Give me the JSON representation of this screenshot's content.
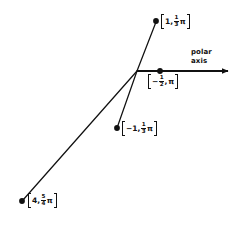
{
  "figure": {
    "background_color": "#ffffff",
    "ink_color": "#111111",
    "width": 243,
    "height": 229
  },
  "axis": {
    "name": "polar axis",
    "label_line1": "polar",
    "label_line2": "axis",
    "origin": {
      "x": 137,
      "y": 71
    },
    "end": {
      "x": 234,
      "y": 71
    },
    "arrowhead": true
  },
  "points": [
    {
      "id": "point-1-one-third-pi",
      "label_open": "[",
      "label_close": "]",
      "r": "1",
      "negative": false,
      "numerator": "1",
      "denominator": "3",
      "symbol": "π",
      "comma": ",",
      "plain_label": "[1, 1/3 π]",
      "dot": {
        "x": 156,
        "y": 21
      },
      "label_pos": {
        "x": 161,
        "y": 13
      }
    },
    {
      "id": "point-neg-half-pi",
      "label_open": "[",
      "label_close": "]",
      "r": "",
      "negative": true,
      "numerator": "1",
      "denominator": "2",
      "symbol": "π",
      "comma": ",",
      "plain_label": "[-1/2, π]",
      "dot": {
        "x": 160,
        "y": 71
      },
      "label_pos": {
        "x": 148,
        "y": 73
      }
    },
    {
      "id": "point-neg1-one-third-pi",
      "label_open": "[",
      "label_close": "]",
      "r": "−1",
      "negative": false,
      "numerator": "1",
      "denominator": "3",
      "symbol": "π",
      "comma": ",",
      "plain_label": "[-1, 1/3 π]",
      "dot": {
        "x": 117,
        "y": 128
      },
      "label_pos": {
        "x": 122,
        "y": 120
      }
    },
    {
      "id": "point-4-five-fourths-pi",
      "label_open": "[",
      "label_close": "]",
      "r": "4",
      "negative": false,
      "numerator": "5",
      "denominator": "4",
      "symbol": "π",
      "comma": ",",
      "plain_label": "[4, 5/4 π]",
      "dot": {
        "x": 22,
        "y": 201
      },
      "label_pos": {
        "x": 28,
        "y": 192
      }
    }
  ],
  "rays": [
    {
      "id": "ray-to-1-one-third-pi",
      "from": {
        "x": 137,
        "y": 71
      },
      "to": {
        "x": 156,
        "y": 22
      }
    },
    {
      "id": "ray-to-neg1-one-third-pi",
      "from": {
        "x": 137,
        "y": 71
      },
      "to": {
        "x": 117,
        "y": 128
      }
    },
    {
      "id": "ray-to-4-five-fourths-pi",
      "from": {
        "x": 137,
        "y": 71
      },
      "to": {
        "x": 23,
        "y": 200
      }
    }
  ]
}
